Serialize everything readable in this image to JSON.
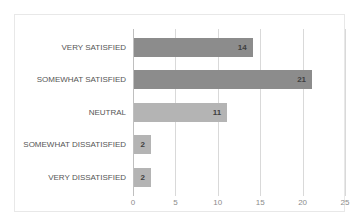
{
  "chart_data": {
    "type": "bar",
    "orientation": "horizontal",
    "title": "",
    "xlabel": "",
    "ylabel": "",
    "xlim": [
      0,
      25
    ],
    "grid": true,
    "legend": false,
    "tick_labels": [
      "0",
      "5",
      "10",
      "15",
      "20",
      "25"
    ],
    "ticks": [
      0,
      5,
      10,
      15,
      20,
      25
    ],
    "categories": [
      "VERY SATISFIED",
      "SOMEWHAT SATISFIED",
      "NEUTRAL",
      "SOMEWHAT DISSATISFIED",
      "VERY DISSATISFIED"
    ],
    "values": [
      14,
      21,
      11,
      2,
      2
    ],
    "data_labels": [
      "14",
      "21",
      "11",
      "2",
      "2"
    ],
    "bar_colors": [
      "#8c8c8c",
      "#8c8c8c",
      "#b4b4b4",
      "#b4b4b4",
      "#b4b4b4"
    ]
  },
  "style": {
    "background": "#ffffff",
    "border_color": "#e8e8e8",
    "gridline_color": "#d9d9d9",
    "axis_color": "#bfbfbf",
    "tick_text_color": "#8c8c8c",
    "category_text_color": "#555555",
    "value_text_color": "#3f3f3f"
  }
}
